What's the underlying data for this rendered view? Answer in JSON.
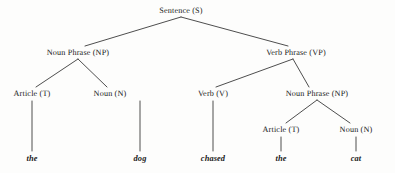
{
  "diagram": {
    "type": "syntax-parse-tree",
    "sentence": "the dog chased the cat",
    "background_color": "#fdfdfc",
    "line_color": "#3a3a3a",
    "text_color": "#1a1a1a",
    "nodes": [
      {
        "id": "s",
        "label": "Sentence (S)",
        "x": 181,
        "y": 10,
        "level": 0
      },
      {
        "id": "np1",
        "label": "Noun Phrase (NP)",
        "x": 78,
        "y": 52,
        "level": 1
      },
      {
        "id": "vp",
        "label": "Verb Phrase (VP)",
        "x": 296,
        "y": 52,
        "level": 1
      },
      {
        "id": "t1",
        "label": "Article (T)",
        "x": 32,
        "y": 93,
        "level": 2
      },
      {
        "id": "n1",
        "label": "Noun (N)",
        "x": 110,
        "y": 93,
        "level": 2
      },
      {
        "id": "v",
        "label": "Verb (V)",
        "x": 213,
        "y": 93,
        "level": 2
      },
      {
        "id": "np2",
        "label": "Noun Phrase (NP)",
        "x": 317,
        "y": 93,
        "level": 2
      },
      {
        "id": "t2",
        "label": "Article (T)",
        "x": 281,
        "y": 129,
        "level": 3
      },
      {
        "id": "n2",
        "label": "Noun (N)",
        "x": 356,
        "y": 129,
        "level": 3
      }
    ],
    "leaves": [
      {
        "id": "leaf-the-1",
        "label": "the",
        "x": 32,
        "y": 158,
        "parent": "t1"
      },
      {
        "id": "leaf-dog",
        "label": "dog",
        "x": 140,
        "y": 158,
        "parent": "n1"
      },
      {
        "id": "leaf-chased",
        "label": "chased",
        "x": 213,
        "y": 158,
        "parent": "v"
      },
      {
        "id": "leaf-the-2",
        "label": "the",
        "x": 281,
        "y": 158,
        "parent": "t2"
      },
      {
        "id": "leaf-cat",
        "label": "cat",
        "x": 356,
        "y": 158,
        "parent": "n2"
      }
    ],
    "edges": [
      {
        "from": "s",
        "to": "np1",
        "x1": 181,
        "y1": 17,
        "x2": 85,
        "y2": 46
      },
      {
        "from": "s",
        "to": "vp",
        "x1": 181,
        "y1": 17,
        "x2": 288,
        "y2": 46
      },
      {
        "from": "np1",
        "to": "t1",
        "x1": 78,
        "y1": 59,
        "x2": 36,
        "y2": 87
      },
      {
        "from": "np1",
        "to": "n1",
        "x1": 78,
        "y1": 59,
        "x2": 107,
        "y2": 87
      },
      {
        "from": "vp",
        "to": "v",
        "x1": 293,
        "y1": 59,
        "x2": 216,
        "y2": 87
      },
      {
        "from": "vp",
        "to": "np2",
        "x1": 293,
        "y1": 59,
        "x2": 309,
        "y2": 87
      },
      {
        "from": "np2",
        "to": "t2",
        "x1": 317,
        "y1": 100,
        "x2": 286,
        "y2": 123
      },
      {
        "from": "np2",
        "to": "n2",
        "x1": 317,
        "y1": 100,
        "x2": 350,
        "y2": 123
      },
      {
        "from": "t1",
        "to": "leaf-the-1",
        "x1": 32,
        "y1": 101,
        "x2": 32,
        "y2": 151
      },
      {
        "from": "n1",
        "to": "leaf-dog",
        "x1": 140,
        "y1": 101,
        "x2": 140,
        "y2": 151
      },
      {
        "from": "v",
        "to": "leaf-chased",
        "x1": 213,
        "y1": 101,
        "x2": 213,
        "y2": 151
      },
      {
        "from": "t2",
        "to": "leaf-the-2",
        "x1": 281,
        "y1": 137,
        "x2": 281,
        "y2": 151
      },
      {
        "from": "n2",
        "to": "leaf-cat",
        "x1": 356,
        "y1": 137,
        "x2": 356,
        "y2": 151
      }
    ]
  }
}
